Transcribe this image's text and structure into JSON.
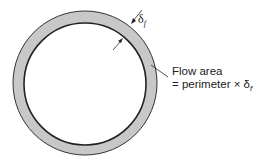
{
  "diagram": {
    "annotation_line1": "Flow area",
    "annotation_line2": "= perimeter × δ",
    "annotation_sub": "f",
    "thickness_symbol": "δ",
    "thickness_sub": "f",
    "colors": {
      "film_fill": "#c8c8c8",
      "outline": "#222222",
      "background": "#ffffff"
    }
  }
}
